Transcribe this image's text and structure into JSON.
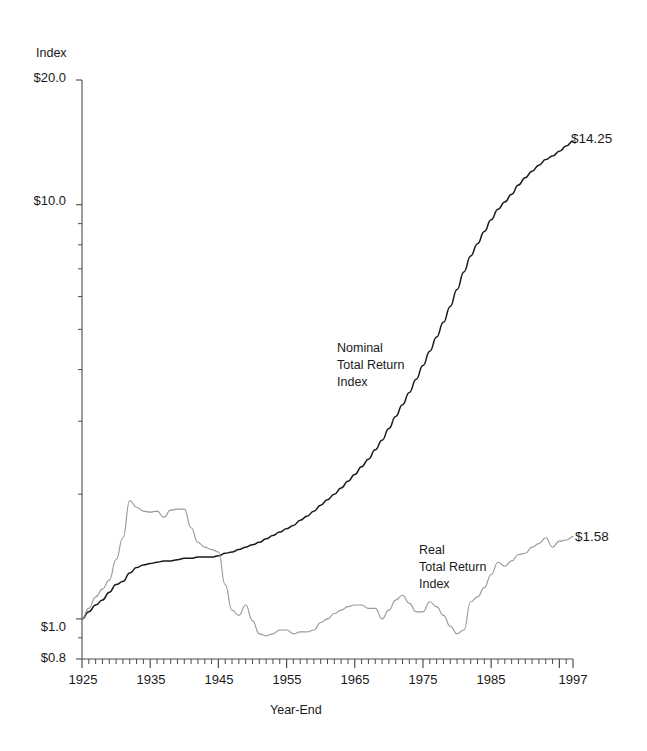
{
  "axes": {
    "y_caption": "Index",
    "y_tick_labels": [
      "$20.0",
      "$10.0",
      "$1.0",
      "$0.8"
    ],
    "x_title": "Year-End",
    "x_tick_labels": [
      "1925",
      "1935",
      "1945",
      "1955",
      "1965",
      "1975",
      "1985",
      "1997"
    ]
  },
  "annotations": {
    "nominal": "Nominal\nTotal Return\nIndex",
    "real": "Real\nTotal Return\nIndex",
    "nominal_endpoint": "$14.25",
    "real_endpoint": "$1.58"
  },
  "colors": {
    "nominal_line": "#1a1a1a",
    "real_line": "#9a9a9a",
    "axis": "#4d4d4d",
    "text": "#1a1a1a",
    "background": "#ffffff"
  },
  "chart_data": {
    "type": "line",
    "title": "",
    "xlabel": "Year-End",
    "ylabel": "Index",
    "yscale": "log",
    "ylim": [
      0.8,
      20.0
    ],
    "xlim": [
      1925,
      1997
    ],
    "ytick_values": [
      20.0,
      10.0,
      1.0,
      0.8
    ],
    "yminor_tick_values": [
      9,
      8,
      7,
      6,
      5,
      4,
      3,
      2,
      0.9
    ],
    "xtick_values": [
      1925,
      1935,
      1945,
      1955,
      1965,
      1975,
      1985,
      1997
    ],
    "xminor_tick_step": 1,
    "grid": false,
    "legend": "inline-annotation",
    "x": [
      1925,
      1926,
      1927,
      1928,
      1929,
      1930,
      1931,
      1932,
      1933,
      1934,
      1935,
      1936,
      1937,
      1938,
      1939,
      1940,
      1941,
      1942,
      1943,
      1944,
      1945,
      1946,
      1947,
      1948,
      1949,
      1950,
      1951,
      1952,
      1953,
      1954,
      1955,
      1956,
      1957,
      1958,
      1959,
      1960,
      1961,
      1962,
      1963,
      1964,
      1965,
      1966,
      1967,
      1968,
      1969,
      1970,
      1971,
      1972,
      1973,
      1974,
      1975,
      1976,
      1977,
      1978,
      1979,
      1980,
      1981,
      1982,
      1983,
      1984,
      1985,
      1986,
      1987,
      1988,
      1989,
      1990,
      1991,
      1992,
      1993,
      1994,
      1995,
      1996,
      1997
    ],
    "series": [
      {
        "name": "Nominal Total Return Index",
        "color": "#1a1a1a",
        "endpoint_label": "$14.25",
        "values": [
          1.0,
          1.04,
          1.08,
          1.11,
          1.16,
          1.21,
          1.23,
          1.29,
          1.33,
          1.35,
          1.36,
          1.37,
          1.38,
          1.38,
          1.39,
          1.4,
          1.4,
          1.41,
          1.41,
          1.41,
          1.42,
          1.44,
          1.45,
          1.47,
          1.49,
          1.51,
          1.53,
          1.56,
          1.59,
          1.62,
          1.65,
          1.68,
          1.73,
          1.77,
          1.82,
          1.88,
          1.94,
          2.0,
          2.07,
          2.15,
          2.23,
          2.33,
          2.43,
          2.56,
          2.7,
          2.88,
          3.08,
          3.29,
          3.52,
          3.79,
          4.09,
          4.43,
          4.79,
          5.2,
          5.68,
          6.24,
          6.88,
          7.52,
          8.05,
          8.62,
          9.2,
          9.75,
          10.15,
          10.6,
          11.15,
          11.62,
          12.05,
          12.45,
          12.85,
          13.1,
          13.45,
          13.85,
          14.25
        ]
      },
      {
        "name": "Real Total Return Index",
        "color": "#9a9a9a",
        "endpoint_label": "$1.58",
        "values": [
          1.0,
          1.06,
          1.13,
          1.18,
          1.24,
          1.39,
          1.57,
          1.93,
          1.86,
          1.82,
          1.81,
          1.82,
          1.76,
          1.83,
          1.84,
          1.84,
          1.66,
          1.53,
          1.49,
          1.47,
          1.45,
          1.21,
          1.05,
          1.02,
          1.08,
          0.99,
          0.92,
          0.91,
          0.92,
          0.94,
          0.94,
          0.92,
          0.93,
          0.93,
          0.94,
          0.98,
          1.0,
          1.03,
          1.05,
          1.07,
          1.08,
          1.08,
          1.06,
          1.06,
          1.0,
          1.05,
          1.11,
          1.14,
          1.09,
          1.04,
          1.04,
          1.1,
          1.07,
          1.02,
          0.96,
          0.92,
          0.94,
          1.1,
          1.13,
          1.19,
          1.28,
          1.37,
          1.34,
          1.38,
          1.43,
          1.44,
          1.49,
          1.52,
          1.57,
          1.49,
          1.54,
          1.55,
          1.58
        ]
      }
    ]
  }
}
